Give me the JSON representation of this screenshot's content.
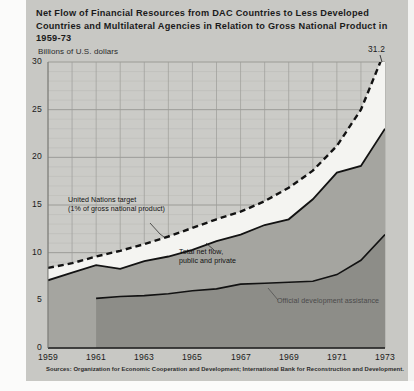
{
  "figure": {
    "title_lines": [
      "Net Flow of Financial Resources from DAC Countries to Less Developed",
      "Countries and Multilateral Agencies in Relation to Gross National Product in",
      "1959-73"
    ],
    "units_label": "Billions of U.S. dollars",
    "peak_value_label": "31.2",
    "source_note": "Sources: Organization for Economic Cooperation and Development; International Bank for Reconstruction and Development."
  },
  "colors": {
    "background": "#c8c8c4",
    "paper": "#fbfbfa",
    "plot_fill": "#cbcbc7",
    "band_fill": "#f4f4f1",
    "area_total": "#a2a29d",
    "area_oda": "#8e8e89",
    "line": "#1b1b1b",
    "grid": "#9a9a96",
    "grid_minor": "#b2b2ae"
  },
  "chart_data": {
    "type": "area",
    "title": "Net Flow of Financial Resources from DAC Countries to Less Developed Countries and Multilateral Agencies in Relation to Gross National Product in 1959-73",
    "subtitle": "Billions of U.S. dollars",
    "xlabel": "",
    "ylabel": "Billions of U.S. dollars",
    "xlim": [
      1959,
      1973
    ],
    "ylim": [
      0,
      30
    ],
    "grid": true,
    "legend_position": "inline-annotations",
    "yticks": [
      0,
      5,
      10,
      15,
      20,
      25,
      30
    ],
    "ytick_labels": [
      "0",
      "5",
      "10",
      "15",
      "20",
      "25",
      "30"
    ],
    "xticks": [
      1959,
      1961,
      1963,
      1965,
      1967,
      1969,
      1971,
      1973
    ],
    "xtick_labels": [
      "1959",
      "1961",
      "1963",
      "1965",
      "1967",
      "1969",
      "1971",
      "1973"
    ],
    "x": [
      1959,
      1960,
      1961,
      1962,
      1963,
      1964,
      1965,
      1966,
      1967,
      1968,
      1969,
      1970,
      1971,
      1972,
      1973
    ],
    "series": [
      {
        "name": "United Nations target (1% of gross national product)",
        "style": "dashed-line",
        "values": [
          8.4,
          8.9,
          9.6,
          10.2,
          10.9,
          11.7,
          12.6,
          13.5,
          14.3,
          15.4,
          16.8,
          18.6,
          21.2,
          25.0,
          31.2
        ]
      },
      {
        "name": "Total net flow, public and private",
        "style": "filled-area",
        "values": [
          7.1,
          7.9,
          8.7,
          8.3,
          9.1,
          9.6,
          10.3,
          11.2,
          11.9,
          12.9,
          13.5,
          15.6,
          18.4,
          19.1,
          23.0
        ]
      },
      {
        "name": "Official development assistance",
        "style": "filled-area",
        "values": [
          null,
          null,
          5.2,
          5.4,
          5.5,
          5.7,
          6.0,
          6.2,
          6.7,
          6.8,
          6.9,
          7.0,
          7.7,
          9.2,
          11.9
        ]
      }
    ],
    "annotations": [
      {
        "id": "un-target",
        "text_lines": [
          "United Nations target",
          "(1% of gross national product)"
        ],
        "points_to": "dashed line"
      },
      {
        "id": "total-net-flow",
        "text_lines": [
          "Total net flow,",
          "public and private"
        ],
        "points_to": "upper area"
      },
      {
        "id": "oda",
        "text_lines": [
          "Official development assistance"
        ],
        "points_to": "lower area"
      }
    ],
    "data_labels": [
      {
        "x": 1973,
        "series": "United Nations target (1% of gross national product)",
        "value": 31.2,
        "label": "31.2"
      }
    ]
  },
  "axis": {
    "y_labels": [
      "30",
      "25",
      "20",
      "15",
      "10",
      "5",
      "0"
    ],
    "x_labels": [
      "1959",
      "1961",
      "1963",
      "1965",
      "1967",
      "1969",
      "1971",
      "1973"
    ]
  },
  "annotations": {
    "un_target_line1": "United Nations target",
    "un_target_line2": "(1% of gross national product)",
    "total_flow_line1": "Total net flow,",
    "total_flow_line2": "public and private",
    "oda": "Official development assistance"
  }
}
